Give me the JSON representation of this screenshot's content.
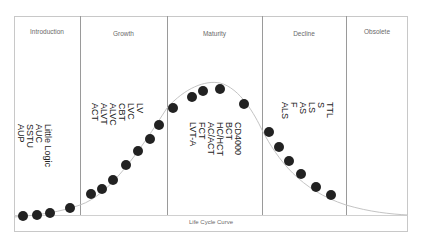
{
  "diagram": {
    "caption": "Life Cycle Curve",
    "stages": [
      {
        "label": "Introduction",
        "items": [
          "Little Logic",
          "AUC",
          "SSTU",
          "AUP"
        ]
      },
      {
        "label": "Growth",
        "items": [
          "LV",
          "LVC",
          "CBT",
          "ALVC",
          "ALVT",
          "ACT"
        ]
      },
      {
        "label": "Maturity",
        "items": [
          "CD4000",
          "BCT",
          "HC/HCT",
          "AC/ACT",
          "FCT",
          "LVT-A"
        ]
      },
      {
        "label": "Decline",
        "items": [
          "TTL",
          "S",
          "LS",
          "AS",
          "F",
          "ALS"
        ]
      },
      {
        "label": "Obsolete",
        "items": []
      }
    ],
    "colors": {
      "dot": "#222222",
      "curve": "#c4c4c4",
      "frame": "#c8c8c8",
      "divider": "#9a9a9a"
    }
  }
}
